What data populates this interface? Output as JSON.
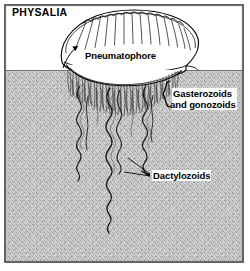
{
  "figure": {
    "title": "PHYSALIA",
    "organism": "Portuguese man o' war",
    "labels": {
      "physalia": "PHYSALIA",
      "pneumatophore": "Pneumatophore",
      "gasterozoids_line1": "Gasterozoids",
      "gasterozoids_line2": "and gonozoids",
      "dactylozoids": "Dactylozoids"
    },
    "colors": {
      "ink": "#000000",
      "sky": "#ffffff",
      "water": "#c9c9c9",
      "water_dark": "#b4b4b4",
      "frame": "#3a3a3a",
      "float_fill": "#ffffff"
    },
    "regions": {
      "above_water": "sky",
      "below_water": "stippled water",
      "waterline_y": 70
    }
  }
}
